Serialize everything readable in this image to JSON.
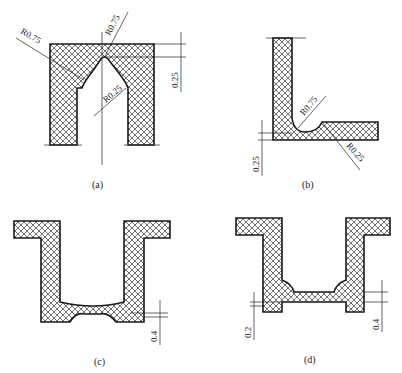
{
  "figure": {
    "panels": [
      {
        "id": "a",
        "caption": "(a)",
        "annotations": {
          "radius_left": "R0.75",
          "radius_top": "R0.75",
          "radius_inner": "R0.25",
          "dimension": "0.25"
        }
      },
      {
        "id": "b",
        "caption": "(b)",
        "annotations": {
          "radius_inner": "R0.75",
          "radius_outer": "R0.25",
          "dimension": "0.25"
        }
      },
      {
        "id": "c",
        "caption": "(c)",
        "annotations": {
          "dimension": "0.4"
        }
      },
      {
        "id": "d",
        "caption": "(d)",
        "annotations": {
          "dimension_left": "0.2",
          "dimension_right": "0.4"
        }
      }
    ]
  },
  "colors": {
    "line": "#1a1a1a",
    "background": "#ffffff"
  }
}
